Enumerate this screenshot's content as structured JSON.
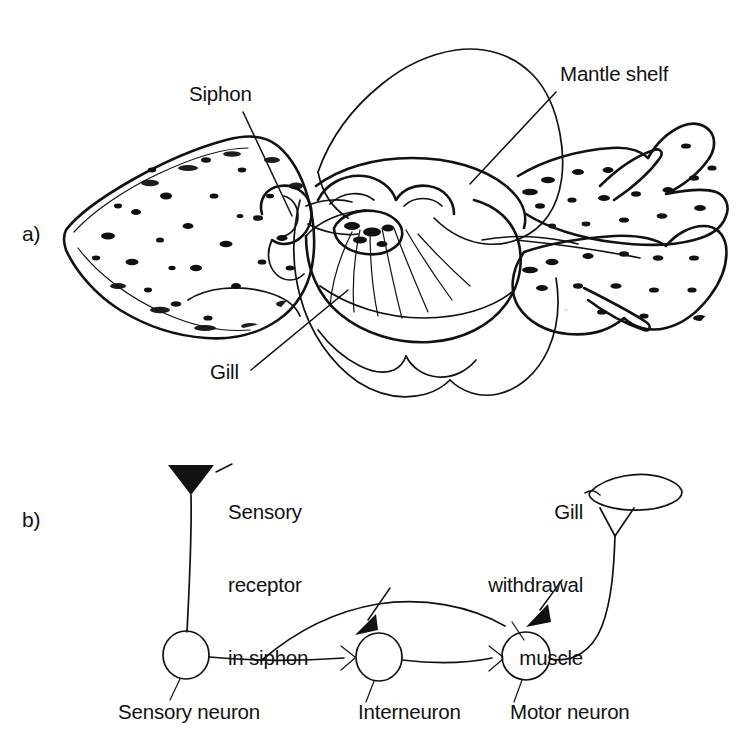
{
  "figure": {
    "type": "two-panel scientific line diagram"
  },
  "panel_a": {
    "marker": "a)",
    "callouts": [
      {
        "id": "siphon",
        "text": "Siphon"
      },
      {
        "id": "mantle-shelf",
        "text": "Mantle shelf"
      },
      {
        "id": "gill",
        "text": "Gill"
      }
    ]
  },
  "panel_b": {
    "marker": "b)",
    "callouts": [
      {
        "id": "sensory-receptor",
        "lines": [
          "Sensory",
          "receptor",
          "in siphon"
        ]
      },
      {
        "id": "gill-muscle",
        "lines": [
          "Gill",
          "withdrawal",
          "muscle"
        ]
      }
    ],
    "receptor_label_l1": "Sensory",
    "receptor_label_l2": "receptor",
    "receptor_label_l3": "in siphon",
    "muscle_label_l1": "Gill",
    "muscle_label_l2": "withdrawal",
    "muscle_label_l3": "muscle",
    "neurons": [
      {
        "id": "sensory-neuron",
        "label": "Sensory neuron"
      },
      {
        "id": "interneuron",
        "label": "Interneuron"
      },
      {
        "id": "motor-neuron",
        "label": "Motor neuron"
      }
    ],
    "sensory_neuron_label": "Sensory neuron",
    "interneuron_label": "Interneuron",
    "motor_neuron_label": "Motor neuron"
  },
  "colors": {
    "ink": "#111111",
    "background": "#ffffff"
  }
}
